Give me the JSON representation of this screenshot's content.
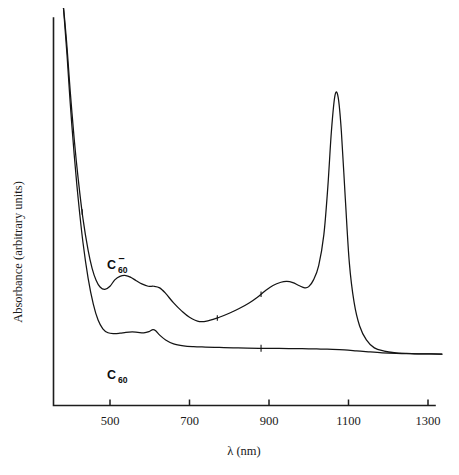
{
  "figure": {
    "name": "absorbance-spectrum",
    "background_color": "#ffffff",
    "line_color": "#141414"
  },
  "chart_data": {
    "type": "line",
    "title": "",
    "subtitle": "",
    "xlabel": "λ  (nm)",
    "ylabel": "Absorbance (arbitrary units)",
    "xlim": [
      380,
      1340
    ],
    "ylim": [
      0,
      1
    ],
    "grid": false,
    "legend_position": "inline-annotation",
    "xticks": [
      500,
      700,
      900,
      1100,
      1300
    ],
    "xtick_labels": [
      "500",
      "700",
      "900",
      "1100",
      "1300"
    ],
    "yticks": [],
    "ytick_labels": [],
    "axis_style": "left-and-bottom-spines-only",
    "annotations": [
      {
        "text": "C60-",
        "display": "C",
        "sub": "60",
        "sup": "–",
        "x_nm": 530,
        "series": "C60-anion"
      },
      {
        "text": "C60",
        "display": "C",
        "sub": "60",
        "sup": "",
        "x_nm": 530,
        "series": "C60-neutral"
      }
    ],
    "series": [
      {
        "name": "C60-anion",
        "label": "C₆₀⁻",
        "color": "#141414",
        "notes": "Fullerene radical anion: intense sharp near-IR band at ~1075 nm, shoulder near 960 nm, broad visible band ~510 nm with shoulder ~620 nm, steep UV tail below 420 nm.",
        "x": [
          383,
          386,
          392,
          400,
          410,
          420,
          432,
          445,
          455,
          465,
          475,
          487,
          500,
          512,
          525,
          540,
          553,
          566,
          580,
          596,
          610,
          625,
          640,
          660,
          680,
          700,
          725,
          750,
          775,
          800,
          825,
          850,
          870,
          890,
          910,
          930,
          945,
          960,
          975,
          990,
          1000,
          1012,
          1025,
          1038,
          1048,
          1057,
          1066,
          1074,
          1082,
          1092,
          1102,
          1114,
          1128,
          1145,
          1165,
          1190,
          1215,
          1245,
          1275,
          1305,
          1335
        ],
        "y": [
          1.0,
          0.97,
          0.9,
          0.79,
          0.67,
          0.57,
          0.47,
          0.39,
          0.345,
          0.315,
          0.298,
          0.292,
          0.3,
          0.316,
          0.325,
          0.327,
          0.322,
          0.314,
          0.306,
          0.3,
          0.3,
          0.296,
          0.282,
          0.258,
          0.238,
          0.222,
          0.211,
          0.214,
          0.222,
          0.232,
          0.244,
          0.258,
          0.272,
          0.288,
          0.302,
          0.31,
          0.312,
          0.309,
          0.302,
          0.296,
          0.299,
          0.316,
          0.352,
          0.43,
          0.55,
          0.69,
          0.78,
          0.775,
          0.69,
          0.52,
          0.36,
          0.26,
          0.2,
          0.165,
          0.145,
          0.137,
          0.133,
          0.131,
          0.13,
          0.13,
          0.129
        ]
      },
      {
        "name": "C60-neutral",
        "label": "C₆₀",
        "color": "#141414",
        "notes": "Neutral C60: steep UV absorption edge, weak broad visible band near 540 nm with small feature ~610 nm, essentially flat transparent baseline through the near-IR.",
        "x": [
          383,
          386,
          392,
          400,
          410,
          420,
          432,
          445,
          458,
          470,
          482,
          495,
          510,
          525,
          540,
          556,
          570,
          585,
          598,
          608,
          615,
          625,
          640,
          660,
          685,
          710,
          740,
          775,
          810,
          845,
          875,
          900,
          925,
          950,
          975,
          1000,
          1030,
          1060,
          1090,
          1120,
          1150,
          1185,
          1220,
          1255,
          1290,
          1335
        ],
        "y": [
          1.0,
          0.96,
          0.88,
          0.76,
          0.63,
          0.52,
          0.41,
          0.32,
          0.255,
          0.215,
          0.193,
          0.183,
          0.181,
          0.182,
          0.184,
          0.185,
          0.184,
          0.183,
          0.186,
          0.191,
          0.188,
          0.177,
          0.165,
          0.155,
          0.15,
          0.148,
          0.147,
          0.146,
          0.145,
          0.1445,
          0.144,
          0.1438,
          0.1435,
          0.1432,
          0.143,
          0.1425,
          0.142,
          0.1412,
          0.1398,
          0.1375,
          0.135,
          0.1325,
          0.131,
          0.1303,
          0.13,
          0.1295
        ]
      }
    ],
    "instrument_artifacts": [
      {
        "x_nm": 430,
        "series": "C60-anion",
        "type": "detector-change-spike"
      },
      {
        "x_nm": 770,
        "series": "C60-anion",
        "type": "detector-change-spike"
      },
      {
        "x_nm": 880,
        "series": "C60-anion",
        "type": "detector-change-spike"
      },
      {
        "x_nm": 880,
        "series": "C60-neutral",
        "type": "detector-change-spike"
      }
    ]
  }
}
